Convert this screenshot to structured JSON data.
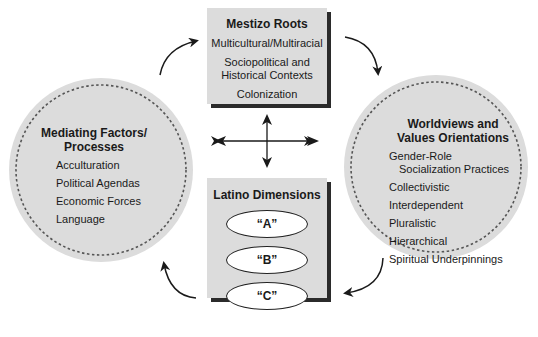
{
  "top_box": {
    "title": "Mestizo Roots",
    "items": [
      "Multicultural/Multiracial",
      "Sociopolitical and",
      "Historical Contexts",
      "Colonization"
    ]
  },
  "left_circle": {
    "title_line1": "Mediating Factors/",
    "title_line2": "Processes",
    "items": [
      "Acculturation",
      "Political Agendas",
      "Economic Forces",
      "Language"
    ]
  },
  "right_circle": {
    "title_line1": "Worldviews and",
    "title_line2": "Values Orientations",
    "items": [
      "Gender-Role",
      "Socialization Practices",
      "Collectivistic",
      "Interdependent",
      "Pluralistic",
      "Hierarchical",
      "Spiritual Underpinnings"
    ]
  },
  "bottom_box": {
    "title": "Latino Dimensions",
    "ellipses": [
      "“A”",
      "“B”",
      "“C”"
    ]
  },
  "colors": {
    "shape_fill": "#dcdcdc",
    "shadow": "#2b2b2b",
    "arrow": "#1a1a1a",
    "dashed_border": "#555555"
  }
}
